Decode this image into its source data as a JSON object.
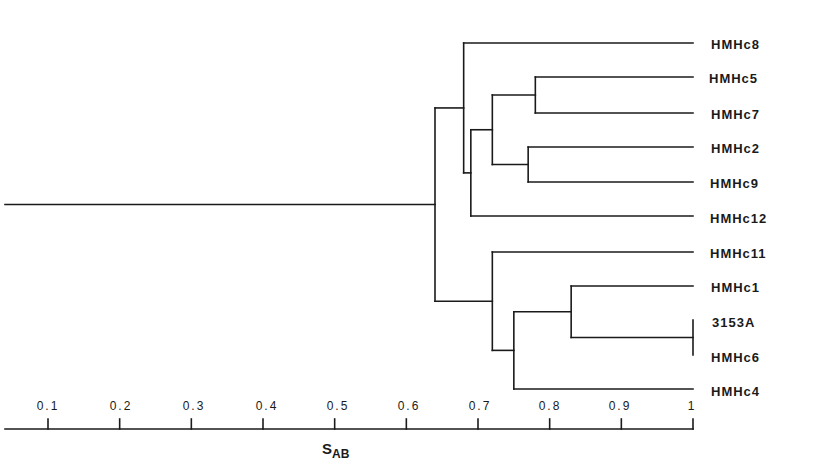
{
  "chart_data": {
    "type": "dendrogram",
    "title": "",
    "xlabel": "S_AB",
    "xlabel_main": "S",
    "xlabel_sub": "AB",
    "xlim": [
      0,
      1
    ],
    "ticks": [
      "0.1",
      "0.2",
      "0.3",
      "0.4",
      "0.5",
      "0.6",
      "0.7",
      "0.8",
      "0.9",
      "1"
    ],
    "tick_values": [
      0.1,
      0.2,
      0.3,
      0.4,
      0.5,
      0.6,
      0.7,
      0.8,
      0.9,
      1.0
    ],
    "leaves": [
      "HMHc8",
      "HMHc5",
      "HMHc7",
      "HMHc2",
      "HMHc9",
      "HMHc12",
      "HMHc11",
      "HMHc1",
      "3153A",
      "HMHc6",
      "HMHc4"
    ],
    "merges": [
      {
        "id": "n1",
        "children": [
          "HMHc5",
          "HMHc7"
        ],
        "similarity": 0.78
      },
      {
        "id": "n2",
        "children": [
          "HMHc2",
          "HMHc9"
        ],
        "similarity": 0.77
      },
      {
        "id": "n3",
        "children": [
          "n1",
          "n2"
        ],
        "similarity": 0.72
      },
      {
        "id": "n4",
        "children": [
          "n3",
          "HMHc12"
        ],
        "similarity": 0.69
      },
      {
        "id": "n5",
        "children": [
          "HMHc8",
          "n4"
        ],
        "similarity": 0.68
      },
      {
        "id": "n6",
        "children": [
          "3153A",
          "HMHc6"
        ],
        "similarity": 1.0
      },
      {
        "id": "n7",
        "children": [
          "HMHc1",
          "n6"
        ],
        "similarity": 0.83
      },
      {
        "id": "n8",
        "children": [
          "n7",
          "HMHc4"
        ],
        "similarity": 0.75
      },
      {
        "id": "n9",
        "children": [
          "HMHc11",
          "n8"
        ],
        "similarity": 0.72
      },
      {
        "id": "root",
        "children": [
          "n5",
          "n9"
        ],
        "similarity": 0.64
      }
    ],
    "grid": false,
    "legend": null
  },
  "labels": {
    "leaves": [
      "HMHc8",
      "HMHc5",
      "HMHc7",
      "HMHc2",
      "HMHc9",
      "HMHc12",
      "HMHc11",
      "HMHc1",
      "3153A",
      "HMHc6",
      "HMHc4"
    ],
    "ticks": [
      "0.1",
      "0.2",
      "0.3",
      "0.4",
      "0.5",
      "0.6",
      "0.7",
      "0.8",
      "0.9",
      "1"
    ],
    "axis_main": "S",
    "axis_sub": "AB"
  },
  "colors": {
    "ink": "#1a1a1a",
    "background": "#ffffff"
  }
}
